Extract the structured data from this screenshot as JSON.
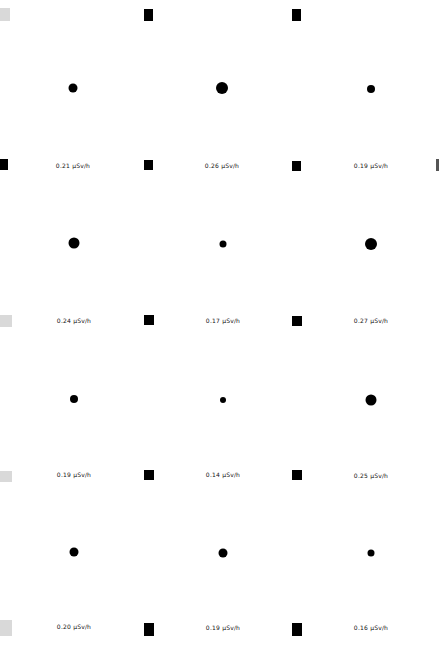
{
  "unit": "µSv/h",
  "colors": {
    "marker": "#000000",
    "ghost_marker": "#d9d9d9",
    "dot": "#000000",
    "background": "#ffffff"
  },
  "grid": {
    "columns": 3,
    "rows": 4,
    "cells": [
      {
        "row": 0,
        "col": 0,
        "value": 0.21,
        "label": "0.21 µSv/h"
      },
      {
        "row": 0,
        "col": 1,
        "value": 0.26,
        "label": "0.26 µSv/h"
      },
      {
        "row": 0,
        "col": 2,
        "value": 0.19,
        "label": "0.19 µSv/h"
      },
      {
        "row": 1,
        "col": 0,
        "value": 0.24,
        "label": "0.24 µSv/h"
      },
      {
        "row": 1,
        "col": 1,
        "value": 0.17,
        "label": "0.17 µSv/h"
      },
      {
        "row": 1,
        "col": 2,
        "value": 0.27,
        "label": "0.27 µSv/h"
      },
      {
        "row": 2,
        "col": 0,
        "value": 0.19,
        "label": "0.19 µSv/h"
      },
      {
        "row": 2,
        "col": 1,
        "value": 0.14,
        "label": "0.14 µSv/h"
      },
      {
        "row": 2,
        "col": 2,
        "value": 0.25,
        "label": "0.25 µSv/h"
      },
      {
        "row": 3,
        "col": 0,
        "value": 0.2,
        "label": "0.20 µSv/h"
      },
      {
        "row": 3,
        "col": 1,
        "value": 0.19,
        "label": "0.19 µSv/h"
      },
      {
        "row": 3,
        "col": 2,
        "value": 0.16,
        "label": "0.16 µSv/h"
      }
    ]
  }
}
